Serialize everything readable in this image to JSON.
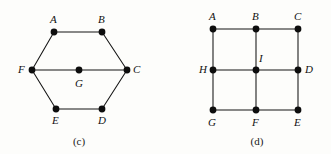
{
  "canvas": {
    "width": 331,
    "height": 154,
    "background": "#fdfdfb"
  },
  "style": {
    "edge_color": "#141414",
    "vertex_color": "#0d0d0d",
    "label_color": "#111111",
    "edge_width": 1.05,
    "vertex_radius": 3.4
  },
  "figures": [
    {
      "id": "figure-c",
      "caption": "(c)",
      "caption_x": 79,
      "caption_y": 136,
      "shape": "hexagon-with-center",
      "vertices": [
        {
          "id": "A",
          "label": "A",
          "x": 54,
          "y": 32,
          "lx": 50,
          "ly": 14
        },
        {
          "id": "B",
          "label": "B",
          "x": 102,
          "y": 32,
          "lx": 98,
          "ly": 14
        },
        {
          "id": "C",
          "label": "C",
          "x": 127,
          "y": 70,
          "lx": 133,
          "ly": 64
        },
        {
          "id": "D",
          "label": "D",
          "x": 102,
          "y": 109,
          "lx": 98,
          "ly": 115
        },
        {
          "id": "E",
          "label": "E",
          "x": 56,
          "y": 109,
          "lx": 52,
          "ly": 115
        },
        {
          "id": "F",
          "label": "F",
          "x": 32,
          "y": 70,
          "lx": 18,
          "ly": 64
        },
        {
          "id": "G",
          "label": "G",
          "x": 79,
          "y": 70,
          "lx": 75,
          "ly": 78
        }
      ],
      "edges": [
        [
          "A",
          "B"
        ],
        [
          "B",
          "C"
        ],
        [
          "C",
          "D"
        ],
        [
          "D",
          "E"
        ],
        [
          "E",
          "F"
        ],
        [
          "F",
          "A"
        ],
        [
          "F",
          "G"
        ],
        [
          "G",
          "C"
        ]
      ]
    },
    {
      "id": "figure-d",
      "caption": "(d)",
      "caption_x": 257,
      "caption_y": 136,
      "shape": "three-by-three-grid",
      "vertices": [
        {
          "id": "A",
          "label": "A",
          "x": 213,
          "y": 29,
          "lx": 209,
          "ly": 11
        },
        {
          "id": "B",
          "label": "B",
          "x": 256,
          "y": 29,
          "lx": 252,
          "ly": 11
        },
        {
          "id": "C",
          "label": "C",
          "x": 298,
          "y": 29,
          "lx": 294,
          "ly": 11
        },
        {
          "id": "D",
          "label": "D",
          "x": 298,
          "y": 70,
          "lx": 305,
          "ly": 64
        },
        {
          "id": "E",
          "label": "E",
          "x": 298,
          "y": 110,
          "lx": 294,
          "ly": 117
        },
        {
          "id": "F",
          "label": "F",
          "x": 256,
          "y": 110,
          "lx": 252,
          "ly": 117
        },
        {
          "id": "G",
          "label": "G",
          "x": 213,
          "y": 110,
          "lx": 208,
          "ly": 117
        },
        {
          "id": "H",
          "label": "H",
          "x": 213,
          "y": 70,
          "lx": 199,
          "ly": 64
        },
        {
          "id": "I",
          "label": "I",
          "x": 256,
          "y": 70,
          "lx": 259,
          "ly": 53
        }
      ],
      "edges": [
        [
          "A",
          "B"
        ],
        [
          "B",
          "C"
        ],
        [
          "H",
          "I"
        ],
        [
          "I",
          "D"
        ],
        [
          "G",
          "F"
        ],
        [
          "F",
          "E"
        ],
        [
          "A",
          "H"
        ],
        [
          "H",
          "G"
        ],
        [
          "B",
          "I"
        ],
        [
          "I",
          "F"
        ],
        [
          "C",
          "D"
        ],
        [
          "D",
          "E"
        ]
      ]
    }
  ]
}
